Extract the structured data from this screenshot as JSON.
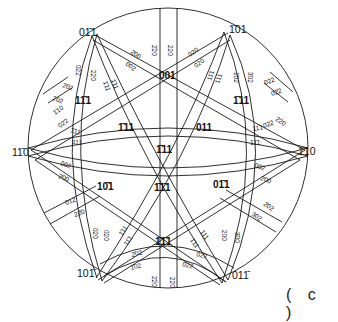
{
  "figure": {
    "caption": "( c )",
    "type": "stereographic projection",
    "circle": {
      "cx": 168,
      "cy": 148,
      "r": 140
    },
    "edge_poles": [
      {
        "label": "01̄1",
        "x": 79,
        "y": 36
      },
      {
        "label": "1̄01",
        "x": 229,
        "y": 33
      },
      {
        "label": "11̄0",
        "x": 12,
        "y": 156
      },
      {
        "label": "1̄10",
        "x": 298,
        "y": 155
      },
      {
        "label": "101̄",
        "x": 77,
        "y": 277
      },
      {
        "label": "011̄",
        "x": 232,
        "y": 279
      }
    ],
    "inner_poles": [
      {
        "label": "001",
        "x": 159,
        "y": 79
      },
      {
        "label": "1̄11",
        "x": 233,
        "y": 104
      },
      {
        "label": "11̄1",
        "x": 75,
        "y": 104
      },
      {
        "label": "1̄11",
        "x": 118,
        "y": 131
      },
      {
        "label": "011",
        "x": 196,
        "y": 131
      },
      {
        "label": "1̄11",
        "x": 156,
        "y": 153
      },
      {
        "label": "10̄1",
        "x": 97,
        "y": 190
      },
      {
        "label": "1̄1̄1",
        "x": 154,
        "y": 191
      },
      {
        "label": "01̄1",
        "x": 213,
        "y": 188
      },
      {
        "label": "1̄1̄1",
        "x": 155,
        "y": 245
      }
    ],
    "band_labels": [
      {
        "label": "2̄00",
        "x": 130,
        "y": 53,
        "rot": 35
      },
      {
        "label": "002",
        "x": 125,
        "y": 65,
        "rot": 35
      },
      {
        "label": "2̄20",
        "x": 152,
        "y": 45,
        "rot": 90
      },
      {
        "label": "220",
        "x": 168,
        "y": 45,
        "rot": 90
      },
      {
        "label": "020",
        "x": 190,
        "y": 57,
        "rot": -35
      },
      {
        "label": "020",
        "x": 196,
        "y": 68,
        "rot": -35
      },
      {
        "label": "022",
        "x": 76,
        "y": 65,
        "rot": 90
      },
      {
        "label": "220",
        "x": 91,
        "y": 70,
        "rot": 90
      },
      {
        "label": "1̄11",
        "x": 111,
        "y": 80,
        "rot": 70
      },
      {
        "label": "1̄11",
        "x": 103,
        "y": 82,
        "rot": 70
      },
      {
        "label": "2̄02",
        "x": 62,
        "y": 87,
        "rot": 20
      },
      {
        "label": "202",
        "x": 52,
        "y": 100,
        "rot": 20
      },
      {
        "label": "1̄10",
        "x": 55,
        "y": 115,
        "rot": -35
      },
      {
        "label": "02̄2",
        "x": 60,
        "y": 128,
        "rot": -35
      },
      {
        "label": "1̄11",
        "x": 70,
        "y": 132,
        "rot": 15
      },
      {
        "label": "111",
        "x": 72,
        "y": 144,
        "rot": 5
      },
      {
        "label": "11̄1",
        "x": 211,
        "y": 81,
        "rot": -70
      },
      {
        "label": "111",
        "x": 219,
        "y": 84,
        "rot": -70
      },
      {
        "label": "1̄02",
        "x": 234,
        "y": 72,
        "rot": 90
      },
      {
        "label": "3̄02",
        "x": 248,
        "y": 72,
        "rot": 90
      },
      {
        "label": "022",
        "x": 265,
        "y": 85,
        "rot": -20
      },
      {
        "label": "02̄2",
        "x": 272,
        "y": 96,
        "rot": -20
      },
      {
        "label": "2̄20",
        "x": 275,
        "y": 120,
        "rot": 35
      },
      {
        "label": "022",
        "x": 264,
        "y": 128,
        "rot": -20
      },
      {
        "label": "11̄1",
        "x": 253,
        "y": 131,
        "rot": -10
      },
      {
        "label": "11̄1",
        "x": 250,
        "y": 145,
        "rot": 0
      },
      {
        "label": "002",
        "x": 60,
        "y": 165,
        "rot": 20
      },
      {
        "label": "2̄00",
        "x": 58,
        "y": 178,
        "rot": 20
      },
      {
        "label": "012",
        "x": 66,
        "y": 205,
        "rot": -20
      },
      {
        "label": "22̄0",
        "x": 75,
        "y": 217,
        "rot": -20
      },
      {
        "label": "020",
        "x": 93,
        "y": 228,
        "rot": 90
      },
      {
        "label": "020",
        "x": 104,
        "y": 230,
        "rot": 90
      },
      {
        "label": "1̄11",
        "x": 122,
        "y": 236,
        "rot": -55
      },
      {
        "label": "11̄1",
        "x": 127,
        "y": 246,
        "rot": -55
      },
      {
        "label": "2̄02",
        "x": 132,
        "y": 257,
        "rot": -15
      },
      {
        "label": "1̄02",
        "x": 131,
        "y": 270,
        "rot": -15
      },
      {
        "label": "2̄20",
        "x": 152,
        "y": 276,
        "rot": 90
      },
      {
        "label": "220",
        "x": 170,
        "y": 277,
        "rot": 90
      },
      {
        "label": "002",
        "x": 254,
        "y": 167,
        "rot": 20
      },
      {
        "label": "2̄00",
        "x": 260,
        "y": 180,
        "rot": 20
      },
      {
        "label": "2̄02",
        "x": 263,
        "y": 205,
        "rot": 35
      },
      {
        "label": "302",
        "x": 251,
        "y": 215,
        "rot": 35
      },
      {
        "label": "200",
        "x": 222,
        "y": 230,
        "rot": 90
      },
      {
        "label": "3̄00",
        "x": 235,
        "y": 232,
        "rot": 90
      },
      {
        "label": "111",
        "x": 200,
        "y": 232,
        "rot": 55
      },
      {
        "label": "1̄11",
        "x": 190,
        "y": 240,
        "rot": 55
      },
      {
        "label": "022",
        "x": 196,
        "y": 256,
        "rot": 15
      },
      {
        "label": "022",
        "x": 182,
        "y": 266,
        "rot": 15
      }
    ]
  }
}
